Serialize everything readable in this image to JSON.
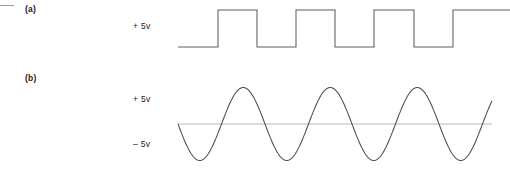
{
  "figure": {
    "background_color": "#ffffff",
    "width": 510,
    "height": 180,
    "leading_tick_icon": "horizontal-dash-icon"
  },
  "panels": [
    {
      "id": "a",
      "label": "(a)",
      "waveform_kind": "square",
      "voltage_labels": [
        {
          "id": "a-high",
          "text": "+ 5v"
        }
      ]
    },
    {
      "id": "b",
      "label": "(b)",
      "waveform_kind": "sine",
      "voltage_labels": [
        {
          "id": "b-high",
          "text": "+ 5v"
        },
        {
          "id": "b-low",
          "text": "– 5v"
        }
      ]
    }
  ],
  "chart_data": [
    {
      "type": "line",
      "id": "square-wave",
      "title": "(a)",
      "waveform": "square",
      "xlabel": "",
      "ylabel": "",
      "grid": false,
      "legend": null,
      "annotations": [
        "+ 5v"
      ],
      "stroke_color": "#5d5d5d",
      "y_levels": {
        "low": 0,
        "high": 5
      },
      "ylim": [
        0,
        5
      ],
      "xlim": [
        178,
        510
      ],
      "period_px": 78,
      "duty_cycle": 0.5,
      "transitions_px": [
        218,
        257,
        296,
        335,
        374,
        414,
        453
      ],
      "start_level": "low",
      "baseline_y_px": 47,
      "high_y_px": 10,
      "points": [
        [
          178,
          0
        ],
        [
          218,
          0
        ],
        [
          218,
          5
        ],
        [
          257,
          5
        ],
        [
          257,
          0
        ],
        [
          296,
          0
        ],
        [
          296,
          5
        ],
        [
          335,
          5
        ],
        [
          335,
          0
        ],
        [
          374,
          0
        ],
        [
          374,
          5
        ],
        [
          414,
          5
        ],
        [
          414,
          0
        ],
        [
          453,
          0
        ],
        [
          453,
          5
        ],
        [
          510,
          5
        ]
      ]
    },
    {
      "type": "line",
      "id": "sine-wave",
      "title": "(b)",
      "waveform": "sine",
      "xlabel": "",
      "ylabel": "",
      "grid": false,
      "legend": null,
      "annotations": [
        "+ 5v",
        "– 5v"
      ],
      "stroke_color": "#4a4a4a",
      "zero_line_color": "#b8b8b8",
      "amplitude_v": 5,
      "ylim": [
        -5,
        5
      ],
      "xlim": [
        178,
        492
      ],
      "period_px": 87,
      "phase": "descending-zero-crossing-at-start",
      "zero_crossings_px": [
        178,
        221.5,
        265,
        308.5,
        352,
        395.5,
        439,
        482.5
      ],
      "zero_y_px": 124,
      "peak_y_px": 88,
      "trough_y_px": 161,
      "cycles_visible": 3.6
    }
  ]
}
